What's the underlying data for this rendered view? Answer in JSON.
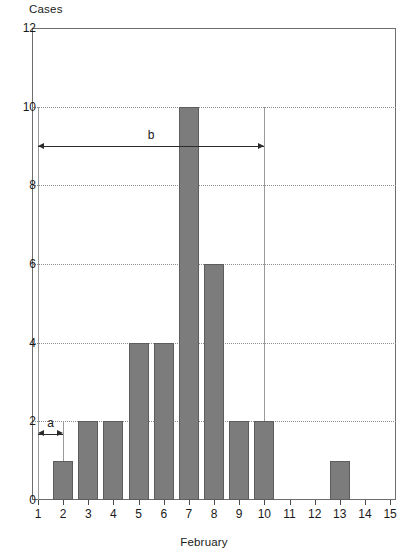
{
  "chart_data": {
    "type": "bar",
    "title": "",
    "subtitle": "",
    "ylabel": "Cases",
    "xlabel": "February",
    "categories": [
      "1",
      "2",
      "3",
      "4",
      "5",
      "6",
      "7",
      "8",
      "9",
      "10",
      "11",
      "12",
      "13",
      "14",
      "15"
    ],
    "values": [
      0,
      1,
      2,
      2,
      4,
      4,
      10,
      6,
      2,
      2,
      0,
      0,
      1,
      0,
      0
    ],
    "series": [
      {
        "name": "Cases",
        "values": [
          0,
          1,
          2,
          2,
          4,
          4,
          10,
          6,
          2,
          2,
          0,
          0,
          1,
          0,
          0
        ]
      }
    ],
    "ylim": [
      0,
      12
    ],
    "yticks": [
      0,
      2,
      4,
      6,
      8,
      10,
      12
    ],
    "ytick_labels": [
      "0",
      "2",
      "4",
      "6",
      "8",
      "10",
      "12"
    ],
    "xlim": [
      0.5,
      15.5
    ],
    "xticks": [
      1,
      2,
      3,
      4,
      5,
      6,
      7,
      8,
      9,
      10,
      11,
      12,
      13,
      14,
      15
    ],
    "xtick_labels": [
      "1",
      "2",
      "3",
      "4",
      "5",
      "6",
      "7",
      "8",
      "9",
      "10",
      "11",
      "12",
      "13",
      "14",
      "15"
    ],
    "grid": "horizontal-dotted",
    "legend": "none",
    "bar_color": "#7c7c7c",
    "bar_edge_color": "#5d5d5d",
    "grid_color": "#8d8d8d",
    "frame_color": "#6d6d6d",
    "annotations": [
      {
        "label": "a",
        "kind": "double-arrow",
        "from_x": 1,
        "to_x": 2,
        "at_y": 1.68,
        "span_days": 1
      },
      {
        "label": "b",
        "kind": "double-arrow",
        "from_x": 1,
        "to_x": 10,
        "at_y": 9.0,
        "span_days": 9
      }
    ],
    "reference_lines": [
      {
        "at_x": 1,
        "from_y": 0,
        "to_y": 10
      },
      {
        "at_x": 2,
        "from_y": 0,
        "to_y": 2
      },
      {
        "at_x": 10,
        "from_y": 0,
        "to_y": 10
      }
    ]
  }
}
